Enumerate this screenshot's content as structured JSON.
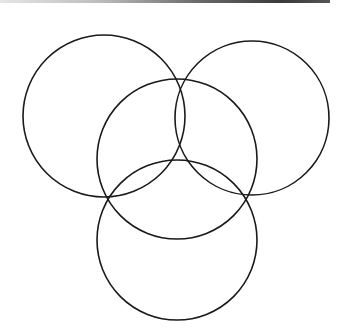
{
  "figure": {
    "kind": "overlapping-circles",
    "stroke_color": "#1a1a1a",
    "stroke_width": 1.6,
    "fill": "none",
    "circles": [
      {
        "id": "top-left",
        "cx": 104,
        "cy": 116,
        "r": 81
      },
      {
        "id": "top-right",
        "cx": 252,
        "cy": 118,
        "r": 77
      },
      {
        "id": "middle",
        "cx": 177,
        "cy": 159,
        "r": 80
      },
      {
        "id": "bottom",
        "cx": 177,
        "cy": 240,
        "r": 80
      }
    ]
  },
  "top_rule": {
    "visible": true
  }
}
